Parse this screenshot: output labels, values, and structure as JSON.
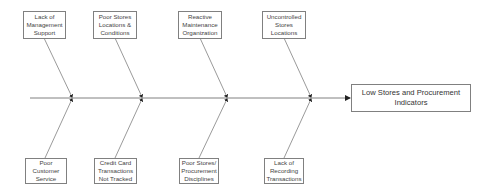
{
  "diagram": {
    "type": "fishbone",
    "effect": "Low Stores and Procurement Indicators",
    "causes_top": [
      "Lack of Management Support",
      "Poor Stores Locations & Conditions",
      "Reactive Maintenance Organization",
      "Uncontrolled Stores Locations"
    ],
    "causes_bottom": [
      "Poor Customer Service",
      "Credit Card Transactions Not Tracked",
      "Poor Stores/ Procurement Disciplines",
      "Lack of Recording Transactions"
    ],
    "colors": {
      "line": "#808080",
      "box_border": "#808080",
      "text": "#444444"
    }
  }
}
